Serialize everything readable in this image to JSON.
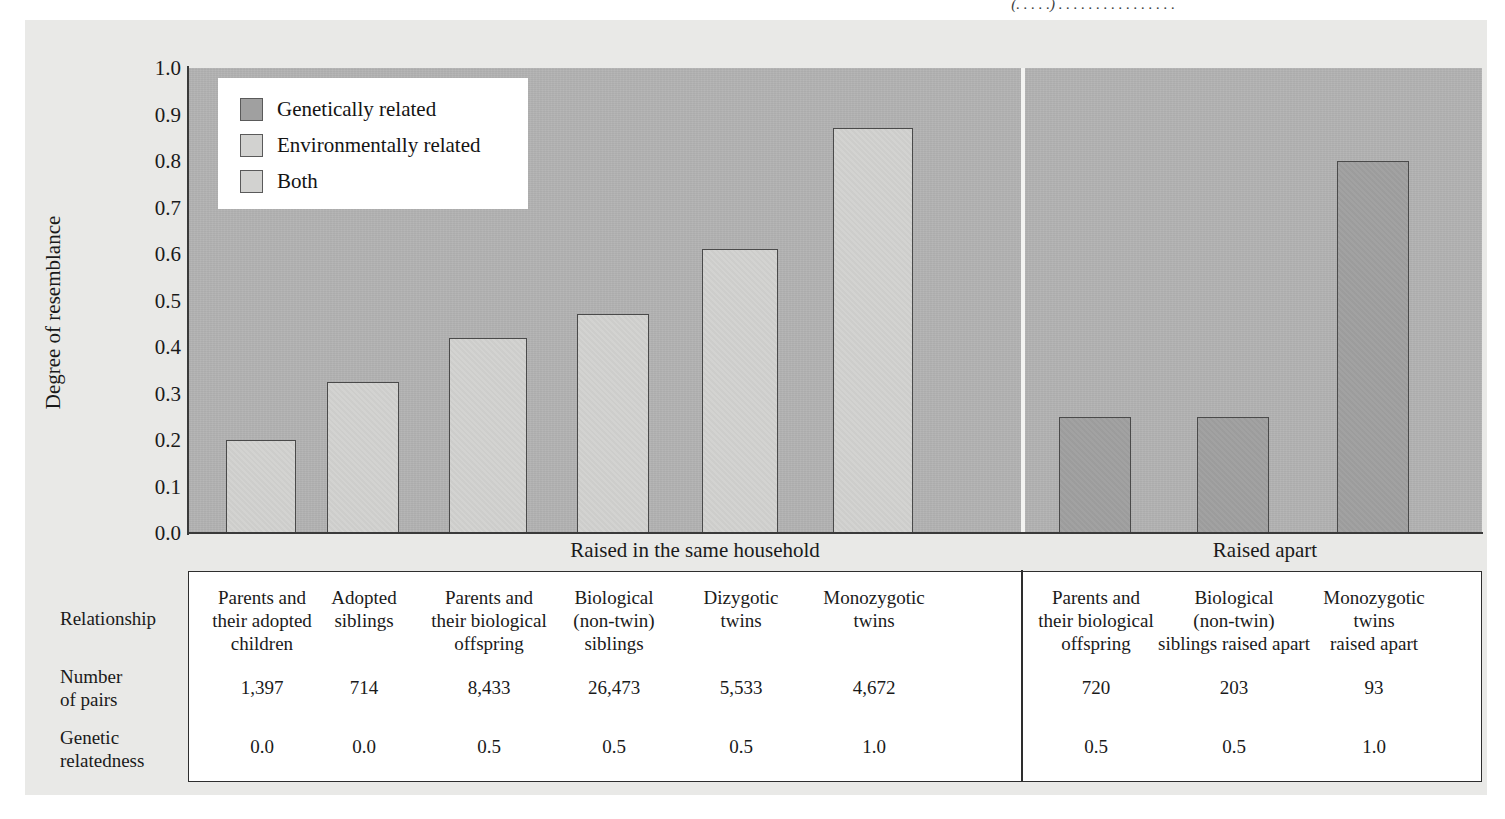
{
  "figure": {
    "top_caption_fragment": "(. . . . .) . . . . . . . . . . . . . . . ."
  },
  "chart_data": {
    "type": "bar",
    "title": "",
    "xlabel": "",
    "ylabel": "Degree of resemblance",
    "ylim": [
      0.0,
      1.0
    ],
    "ytick_labels": [
      "1.0",
      "0.9",
      "0.8",
      "0.7",
      "0.6",
      "0.5",
      "0.4",
      "0.3",
      "0.2",
      "0.1",
      "0.0"
    ],
    "ytick_values": [
      1.0,
      0.9,
      0.8,
      0.7,
      0.6,
      0.5,
      0.4,
      0.3,
      0.2,
      0.1,
      0.0
    ],
    "grid": false,
    "legend_position": "top-left",
    "legend": [
      {
        "label": "Genetically related",
        "color": "#a0a0a0",
        "key": "gen"
      },
      {
        "label": "Environmentally related",
        "color": "#d2d2d0",
        "key": "env"
      },
      {
        "label": "Both",
        "color": "#d2d2d0",
        "key": "both"
      }
    ],
    "groups": [
      {
        "label": "Raised in the same household"
      },
      {
        "label": "Raised apart"
      }
    ],
    "categories": [
      "Parents and their adopted children",
      "Adopted siblings",
      "Parents and their biological offspring",
      "Biological (non-twin) siblings",
      "Dizygotic twins",
      "Monozygotic twins",
      "Parents and their biological offspring",
      "Biological (non-twin) siblings raised apart",
      "Monozygotic twins raised apart"
    ],
    "values": [
      0.2,
      0.325,
      0.42,
      0.47,
      0.61,
      0.87,
      0.25,
      0.25,
      0.8
    ],
    "series": [
      {
        "name": "Degree of resemblance",
        "values": [
          0.2,
          0.325,
          0.42,
          0.47,
          0.61,
          0.87,
          0.25,
          0.25,
          0.8
        ],
        "bar_kinds": [
          "both",
          "both",
          "both",
          "both",
          "both",
          "both",
          "gen",
          "gen",
          "gen"
        ],
        "group_index": [
          0,
          0,
          0,
          0,
          0,
          0,
          1,
          1,
          1
        ]
      }
    ]
  },
  "table": {
    "row_labels": [
      "Relationship",
      "Number of pairs",
      "Genetic relatedness"
    ],
    "columns": [
      {
        "relationship": "Parents and their adopted children",
        "relationship_lines": [
          "Parents and",
          "their adopted",
          "children"
        ],
        "pairs": "1,397",
        "relatedness": "0.0"
      },
      {
        "relationship": "Adopted siblings",
        "relationship_lines": [
          "Adopted",
          "siblings"
        ],
        "pairs": "714",
        "relatedness": "0.0"
      },
      {
        "relationship": "Parents and their biological offspring",
        "relationship_lines": [
          "Parents and",
          "their biological",
          "offspring"
        ],
        "pairs": "8,433",
        "relatedness": "0.5"
      },
      {
        "relationship": "Biological (non-twin) siblings",
        "relationship_lines": [
          "Biological",
          "(non-twin)",
          "siblings"
        ],
        "pairs": "26,473",
        "relatedness": "0.5"
      },
      {
        "relationship": "Dizygotic twins",
        "relationship_lines": [
          "Dizygotic",
          "twins"
        ],
        "pairs": "5,533",
        "relatedness": "0.5"
      },
      {
        "relationship": "Monozygotic twins",
        "relationship_lines": [
          "Monozygotic",
          "twins"
        ],
        "pairs": "4,672",
        "relatedness": "1.0"
      },
      {
        "relationship": "Parents and their biological offspring",
        "relationship_lines": [
          "Parents and",
          "their biological",
          "offspring"
        ],
        "pairs": "720",
        "relatedness": "0.5"
      },
      {
        "relationship": "Biological (non-twin) siblings raised apart",
        "relationship_lines": [
          "Biological",
          "(non-twin)",
          "siblings raised apart"
        ],
        "pairs": "203",
        "relatedness": "0.5"
      },
      {
        "relationship": "Monozygotic twins raised apart",
        "relationship_lines": [
          "Monozygotic",
          "twins",
          "raised apart"
        ],
        "pairs": "93",
        "relatedness": "1.0"
      }
    ]
  },
  "colors": {
    "page_panel": "#e9e9e7",
    "plot_bg": "#b2b2b2",
    "bar_light": "#d2d2d0",
    "bar_dark": "#a0a0a0",
    "outline": "#4a4a4a",
    "text": "#1a1a1a"
  }
}
